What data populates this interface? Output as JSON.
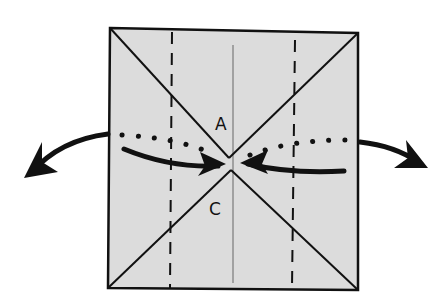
{
  "diagram": {
    "type": "origami-fold-step",
    "labels": {
      "upper": "A",
      "lower": "C"
    },
    "colors": {
      "paper": "#dcdcdc",
      "ink": "#111111",
      "background": "#ffffff"
    },
    "elements": [
      "square paper",
      "diagonal creases",
      "two vertical valley dashed lines",
      "center crease",
      "dotted fold line",
      "inward push arrows",
      "outward swing arrows"
    ]
  }
}
